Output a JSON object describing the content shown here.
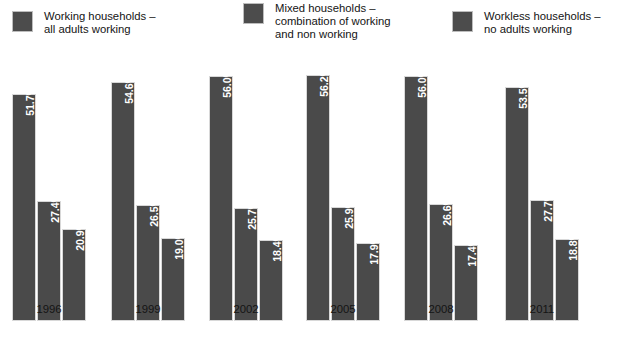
{
  "chart_data": {
    "type": "bar",
    "title": "",
    "subtitle": "",
    "xlabel": "",
    "ylabel": "",
    "ylim": [
      0,
      60
    ],
    "grid": false,
    "legend_position": "top",
    "categories": [
      "1996",
      "1999",
      "2002",
      "2005",
      "2008",
      "2011"
    ],
    "series": [
      {
        "name": "Working households – all adults working",
        "color": "#4a4a4a",
        "values": [
          51.7,
          54.6,
          56.0,
          56.2,
          56.0,
          53.5
        ],
        "labels": [
          "51.7%",
          "54.6%",
          "56.0%",
          "56.2%",
          "56.0%",
          "53.5%"
        ]
      },
      {
        "name": "Mixed households – combination of working and non working",
        "color": "#4a4a4a",
        "values": [
          27.4,
          26.5,
          25.7,
          25.9,
          26.6,
          27.7
        ],
        "labels": [
          "27.4%",
          "26.5%",
          "25.7%",
          "25.9%",
          "26.6%",
          "27.7%"
        ]
      },
      {
        "name": "Workless households – no adults working",
        "color": "#4a4a4a",
        "values": [
          20.9,
          19.0,
          18.4,
          17.9,
          17.4,
          18.8
        ],
        "labels": [
          "20.9%",
          "19.0%",
          "18.4%",
          "17.9%",
          "17.4%",
          "18.8%"
        ]
      }
    ]
  },
  "legend": {
    "items": [
      {
        "label": "Working households –\nall adults working",
        "color": "#4a4a4a"
      },
      {
        "label": "Mixed households –\ncombination of working\nand non working",
        "color": "#4a4a4a"
      },
      {
        "label": "Workless households –\nno adults working",
        "color": "#4a4a4a"
      }
    ]
  }
}
